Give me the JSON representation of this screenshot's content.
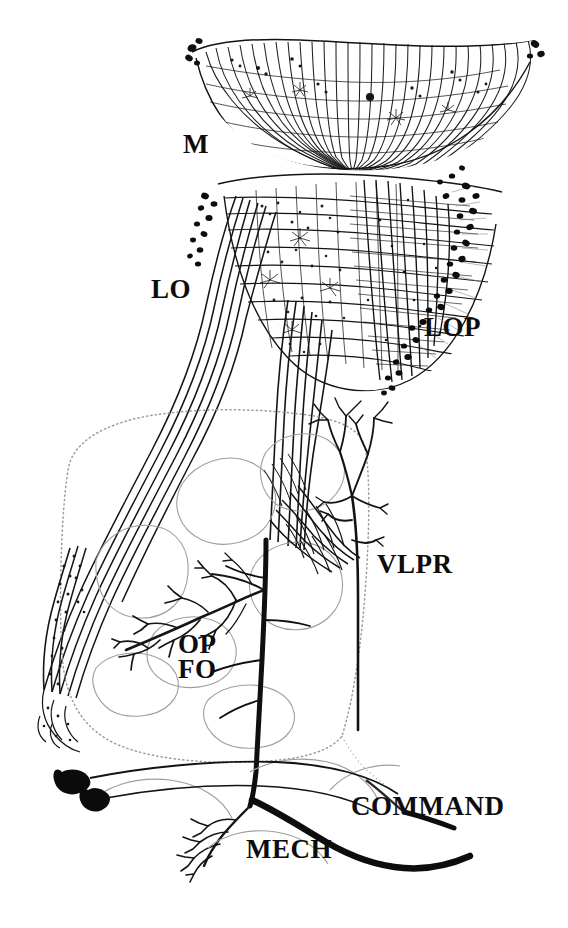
{
  "figure": {
    "background_color": "#ffffff",
    "ink_color": "#111111",
    "faint_ink_color": "#9a9a9a",
    "width": 568,
    "height": 928
  },
  "labels": {
    "medulla": "M",
    "lobula": "LO",
    "lobula_plate": "LOP",
    "ventrolateral_protocerebrum": "VLPR",
    "optic_foci_op": "OP",
    "optic_foci_fo": "FO",
    "mechanosensory": "MECH",
    "command": "COMMAND"
  },
  "regions": [
    {
      "name": "medulla",
      "label": "M",
      "description": "upper fan-shaped neuropil with radial columnar fibers"
    },
    {
      "name": "lobula",
      "label": "LO",
      "description": "middle neuropil with layered tangential fibers"
    },
    {
      "name": "lobula-plate",
      "label": "LOP",
      "description": "posterior layered neuropil bordered by a chain of dark somata"
    },
    {
      "name": "ventrolateral-protocerebrum",
      "label": "VLPR",
      "description": "dotted-outline central brain region containing arborizations"
    },
    {
      "name": "optic-foci",
      "label": "OP FO",
      "description": "optic foci arborization field in central brain"
    },
    {
      "name": "mechanosensory-arbor",
      "label": "MECH",
      "description": "fine branching mechanosensory afferent arbor"
    },
    {
      "name": "command-axon",
      "label": "COMMAND",
      "description": "thick descending command fiber exiting to the right"
    }
  ],
  "somata": {
    "count_visible": 2,
    "description": "two filled cell bodies at lower left giving rise to descending axons"
  }
}
